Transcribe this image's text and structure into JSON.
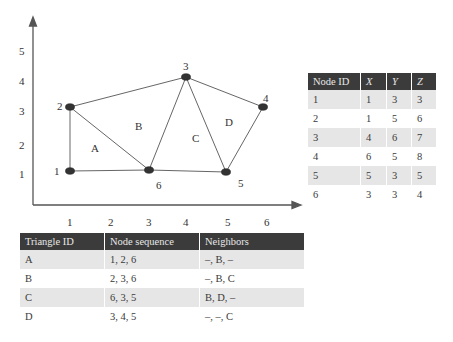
{
  "diagram": {
    "y_ticks": [
      "1",
      "2",
      "3",
      "4",
      "5"
    ],
    "x_ticks": [
      "1",
      "2",
      "3",
      "4",
      "5",
      "6"
    ],
    "nodes": [
      {
        "id": "1",
        "x": 70,
        "y": 171
      },
      {
        "id": "2",
        "x": 70,
        "y": 107
      },
      {
        "id": "3",
        "x": 186,
        "y": 77
      },
      {
        "id": "4",
        "x": 263,
        "y": 107
      },
      {
        "id": "5",
        "x": 226,
        "y": 172
      },
      {
        "id": "6",
        "x": 149,
        "y": 170
      }
    ],
    "triangle_labels": [
      "A",
      "B",
      "C",
      "D"
    ]
  },
  "node_table": {
    "headers": [
      "Node ID",
      "X",
      "Y",
      "Z"
    ],
    "rows": [
      [
        "1",
        "1",
        "3",
        "3"
      ],
      [
        "2",
        "1",
        "5",
        "6"
      ],
      [
        "3",
        "4",
        "6",
        "7"
      ],
      [
        "4",
        "6",
        "5",
        "8"
      ],
      [
        "5",
        "5",
        "3",
        "5"
      ],
      [
        "6",
        "3",
        "3",
        "4"
      ]
    ]
  },
  "triangle_table": {
    "headers": [
      "Triangle ID",
      "Node sequence",
      "Neighbors"
    ],
    "rows": [
      [
        "A",
        "1, 2, 6",
        "–, B, –"
      ],
      [
        "B",
        "2, 3, 6",
        "–, B, C"
      ],
      [
        "C",
        "6, 3, 5",
        "B, D, –"
      ],
      [
        "D",
        "3, 4, 5",
        "–, –, C"
      ]
    ]
  }
}
